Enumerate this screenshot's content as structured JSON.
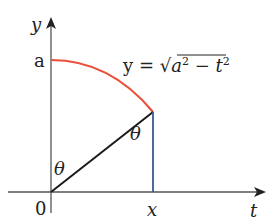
{
  "diagram": {
    "axes": {
      "y_label": "y",
      "x_label": "t",
      "origin_label": "0"
    },
    "labels": {
      "a_tick": "a",
      "x_tick": "x",
      "angle_bottom": "θ",
      "angle_top": "θ"
    },
    "equation": {
      "lhs": "y = ",
      "radical": "√",
      "a": "a",
      "a_exp": "2",
      "minus": " − ",
      "t": "t",
      "t_exp": "2"
    },
    "colors": {
      "axis": "#555555",
      "curve": "#e8503a",
      "hypotenuse": "#1a1a1a",
      "vertical": "#3b5a8c"
    }
  }
}
